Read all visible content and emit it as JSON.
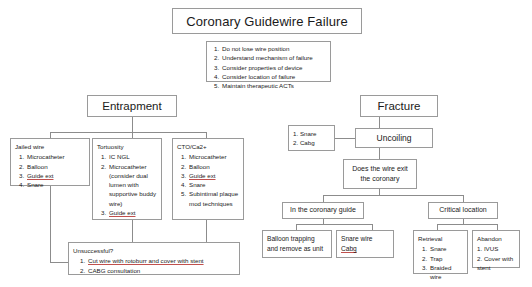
{
  "diagram": {
    "title": "Coronary Guidewire Failure",
    "principles": [
      "Do not lose wire position",
      "Understand mechanism of failure",
      "Consider properties of device",
      "Consider location of failure",
      "Maintain therapeutic ACTs"
    ],
    "entrapment": {
      "label": "Entrapment",
      "jailed_wire": {
        "label": "Jailed wire",
        "items": [
          "Microcatheter",
          "Balloon",
          "Guide ext",
          "Snare"
        ]
      },
      "tortuosity": {
        "label": "Tortuosity",
        "items": [
          "IC NGL",
          "Microcatheter (consider dual lumen with supportive buddy wire)",
          "Guide ext"
        ]
      },
      "cto": {
        "label": "CTO/Ca2+",
        "items": [
          "Microcatheter",
          "Balloon",
          "Guide ext",
          "Snare",
          "Subintimal plaque mod techniques"
        ]
      },
      "unsuccessful": {
        "label": "Unsuccessful?",
        "items": [
          "Cut wire with rotoburr and cover with stent",
          "CABG consultation"
        ]
      }
    },
    "fracture": {
      "label": "Fracture",
      "uncoiling": "Uncoiling",
      "uncoiling_options": [
        "1. Snare",
        "2. Cabg"
      ],
      "question": "Does the wire exit the coronary",
      "in_guide": {
        "label": "In the coronary guide",
        "balloon_trapping": [
          "Balloon trapping",
          "and remove as unit"
        ],
        "snare_wire": [
          "Snare wire",
          "Cabg"
        ]
      },
      "critical_location": {
        "label": "Critical location",
        "retrieval": {
          "label": "Retrieval",
          "items": [
            "Snare",
            "Trap",
            "Braided wire"
          ]
        },
        "abandon": {
          "label": "Abandon",
          "items": [
            "1. IVUS",
            "2. Cover with stent"
          ]
        }
      }
    }
  },
  "colors": {
    "border": "#9a9a9a",
    "line": "#8c8c8c",
    "text": "#1a1a1a",
    "underline": "#c0504d"
  }
}
